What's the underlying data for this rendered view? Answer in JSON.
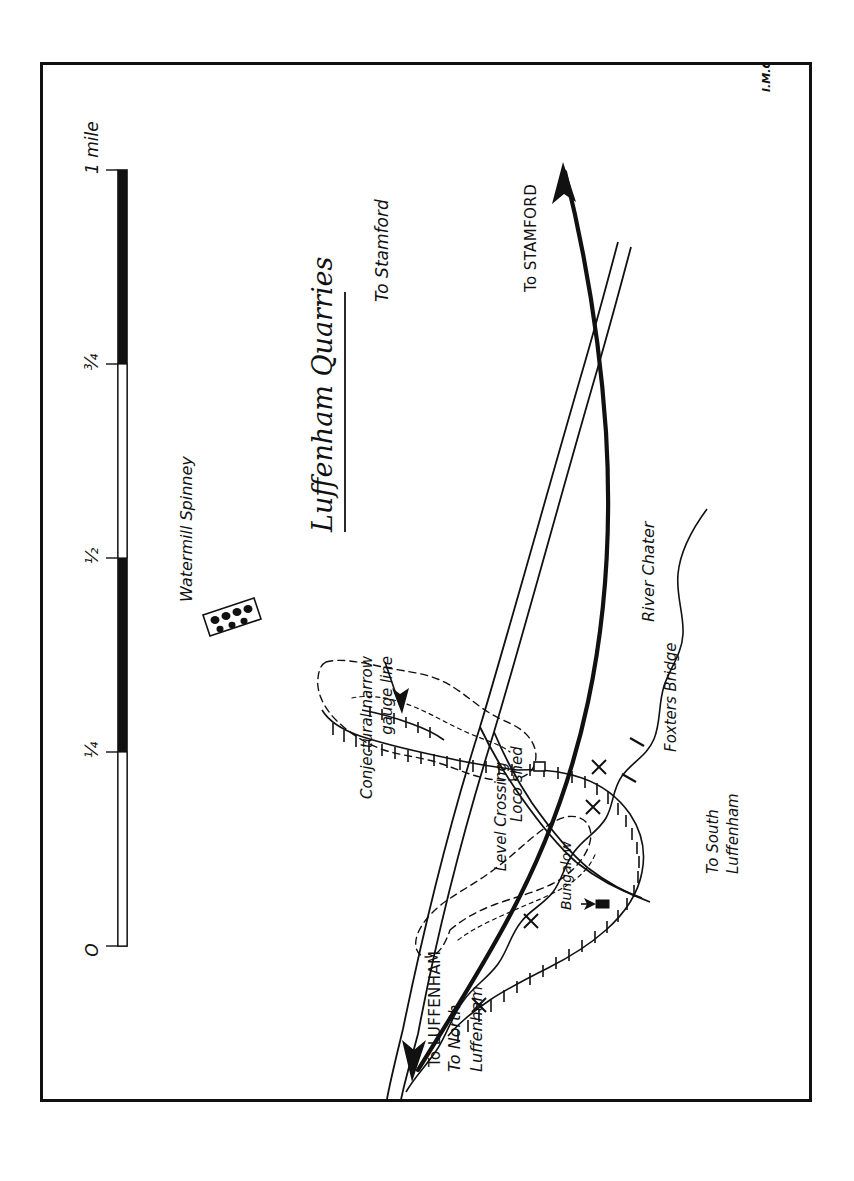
{
  "document": {
    "kind": "hand-drawn-map",
    "orientation": "rotated-90-ccw",
    "signature": "I.M.C."
  },
  "title": {
    "text": "Luffenham Quarries",
    "underlined": true
  },
  "scale_bar": {
    "ticks": [
      "O",
      "¼",
      "½",
      "¾",
      "1 mile"
    ],
    "unit": "mile",
    "segments": 4
  },
  "labels": {
    "watermill_spinney": "Watermill Spinney",
    "conjectural_line": "Conjectural narrow\ngauge line",
    "conjectural_line_1": "Conjectural narrow",
    "conjectural_line_2": "gauge line",
    "level_crossing": "Level Crossing",
    "loco_shed": "Loco shed",
    "bungalow": "Bungalow",
    "river_chater": "River Chater",
    "foxters_bridge": "Foxters Bridge",
    "to_stamford_road": "To Stamford",
    "to_stamford_rail": "To STAMFORD",
    "to_north_luffenham_1": "To North",
    "to_north_luffenham_2": "Luffenham",
    "to_south_luffenham_1": "To South",
    "to_south_luffenham_2": "Luffenham",
    "to_luffenham_rail": "To LUFFENHAM"
  },
  "features": [
    {
      "name": "Watermill Spinney",
      "type": "woodland"
    },
    {
      "name": "Conjectural narrow gauge line",
      "type": "tramway-annotation"
    },
    {
      "name": "Level Crossing",
      "type": "crossing"
    },
    {
      "name": "Loco shed",
      "type": "building"
    },
    {
      "name": "Bungalow",
      "type": "building"
    },
    {
      "name": "River Chater",
      "type": "river"
    },
    {
      "name": "Foxters Bridge",
      "type": "bridge"
    },
    {
      "name": "To Stamford",
      "type": "road-direction"
    },
    {
      "name": "To STAMFORD",
      "type": "railway-direction"
    },
    {
      "name": "To North Luffenham",
      "type": "road-direction"
    },
    {
      "name": "To South Luffenham",
      "type": "road-direction"
    },
    {
      "name": "To LUFFENHAM",
      "type": "railway-direction"
    }
  ],
  "colors": {
    "ink": "#111111",
    "paper": "#ffffff"
  }
}
